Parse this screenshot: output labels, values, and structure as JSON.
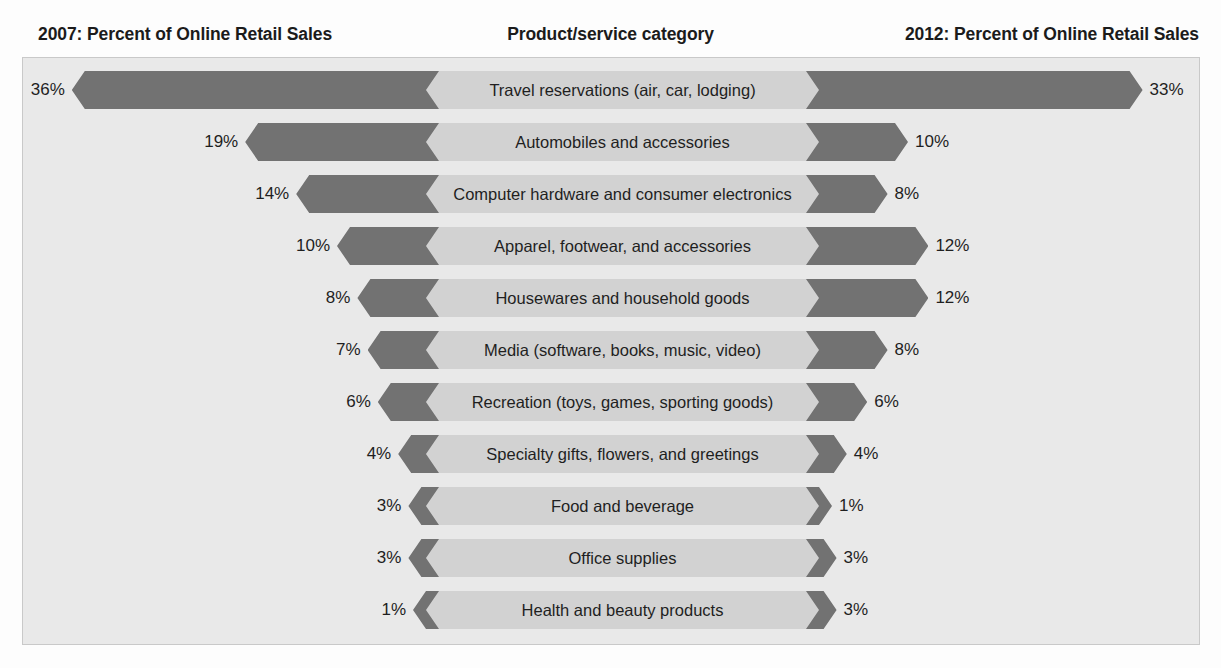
{
  "header": {
    "left_title": "2007: Percent of Online Retail Sales",
    "center_title": "Product/service category",
    "right_title": "2012: Percent of Online Retail Sales"
  },
  "colors": {
    "bar": "#727272",
    "band": "#d2d2d2",
    "plot_background": "#e9e9e9",
    "page_background": "#fdfdfd",
    "text": "#1f1f1f"
  },
  "chart_data": {
    "type": "bar",
    "title": "",
    "subtitle": "",
    "xlabel": "",
    "ylabel": "Product/service category",
    "orientation": "horizontal",
    "style": "bidirectional-tornado",
    "grid": false,
    "legend_position": "none",
    "axis_note": "Bar lengths scale from a fixed central band outward; values are percent of online retail sales.",
    "xlim": [
      0,
      36
    ],
    "categories": [
      "Travel reservations (air, car, lodging)",
      "Automobiles and accessories",
      "Computer hardware and consumer electronics",
      "Apparel, footwear, and accessories",
      "Housewares and household goods",
      "Media (software, books, music, video)",
      "Recreation (toys, games, sporting goods)",
      "Specialty gifts, flowers, and greetings",
      "Food and beverage",
      "Office supplies",
      "Health and beauty products"
    ],
    "series": [
      {
        "name": "2007: Percent of Online Retail Sales",
        "side": "left",
        "values": [
          36,
          19,
          14,
          10,
          8,
          7,
          6,
          4,
          3,
          3,
          1
        ],
        "labels": [
          "36%",
          "19%",
          "14%",
          "10%",
          "8%",
          "7%",
          "6%",
          "4%",
          "3%",
          "3%",
          "1%"
        ]
      },
      {
        "name": "2012: Percent of Online Retail Sales",
        "side": "right",
        "values": [
          33,
          10,
          8,
          12,
          12,
          8,
          6,
          4,
          1,
          3,
          3
        ],
        "labels": [
          "33%",
          "10%",
          "8%",
          "12%",
          "12%",
          "8%",
          "6%",
          "4%",
          "1%",
          "3%",
          "3%"
        ]
      }
    ]
  }
}
